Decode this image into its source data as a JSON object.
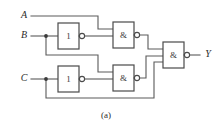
{
  "figure": {
    "caption": "(a)",
    "caption_x": 106,
    "caption_y": 116,
    "width": 221,
    "height": 131,
    "background": "#ffffff",
    "wire_color": "#5a5a5a",
    "gate_outline_color": "#4a4a4a",
    "text_color": "#2b2b2b"
  },
  "inputs": [
    {
      "id": "A",
      "label": "A",
      "label_x": 24,
      "label_y": 16,
      "wire_y": 16
    },
    {
      "id": "B",
      "label": "B",
      "label_x": 24,
      "label_y": 36,
      "wire_y": 36
    },
    {
      "id": "C",
      "label": "C",
      "label_x": 24,
      "label_y": 79,
      "wire_y": 79
    }
  ],
  "outputs": [
    {
      "id": "Y",
      "label": "Y",
      "label_x": 208,
      "label_y": 55,
      "wire_y": 55
    }
  ],
  "gates": [
    {
      "id": "not-b",
      "type": "inverter",
      "label": "1",
      "x": 58,
      "y": 23,
      "w": 21,
      "h": 26,
      "bubble_cx": 82,
      "bubble_cy": 36,
      "bubble_r": 2.6
    },
    {
      "id": "not-c",
      "type": "inverter",
      "label": "1",
      "x": 58,
      "y": 66,
      "w": 21,
      "h": 26,
      "bubble_cx": 82,
      "bubble_cy": 79,
      "bubble_r": 2.6
    },
    {
      "id": "nand-top",
      "type": "nand",
      "label": "&",
      "x": 113,
      "y": 22,
      "w": 21,
      "h": 26,
      "bubble_cx": 137,
      "bubble_cy": 35,
      "bubble_r": 2.6
    },
    {
      "id": "nand-bottom",
      "type": "nand",
      "label": "&",
      "x": 113,
      "y": 65,
      "w": 21,
      "h": 26,
      "bubble_cx": 137,
      "bubble_cy": 78,
      "bubble_r": 2.6
    },
    {
      "id": "nand-output",
      "type": "nand",
      "label": "&",
      "x": 163,
      "y": 42,
      "w": 21,
      "h": 26,
      "bubble_cx": 187,
      "bubble_cy": 55,
      "bubble_r": 2.6
    }
  ],
  "junctions": [
    {
      "id": "b-tap",
      "cx": 46,
      "cy": 36,
      "r": 1.9
    },
    {
      "id": "c-tap",
      "cx": 46,
      "cy": 79,
      "r": 1.9
    }
  ],
  "wires": [
    {
      "id": "a-in-to-nand-top",
      "points": "31,16 98,16 98,29 113,29"
    },
    {
      "id": "b-in-to-not-b",
      "points": "31,36 58,36"
    },
    {
      "id": "not-b-out-to-nand-top",
      "points": "85,36 113,36"
    },
    {
      "id": "b-branch-to-nand-bottom",
      "points": "46,36 46,55 98,55 98,72 113,72"
    },
    {
      "id": "c-in-to-not-c",
      "points": "31,79 58,79"
    },
    {
      "id": "not-c-out-to-nand-bottom",
      "points": "85,79 113,79"
    },
    {
      "id": "c-branch-to-nand-output",
      "points": "46,79 46,98 154,98 154,62 163,62"
    },
    {
      "id": "nand-top-out-to-nand-output",
      "points": "140,35 148,35 148,49 163,49"
    },
    {
      "id": "nand-bottom-out-to-nand-output",
      "points": "140,78 146,78 146,56 163,56"
    },
    {
      "id": "nand-output-to-y",
      "points": "190,55 200,55"
    }
  ]
}
